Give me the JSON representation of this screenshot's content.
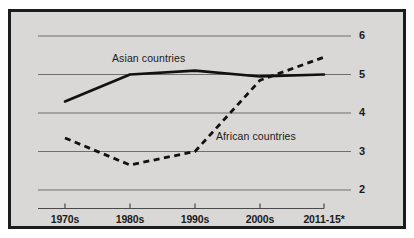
{
  "chart_data": {
    "type": "line",
    "title": "",
    "subtitle": "",
    "xlabel": "",
    "ylabel": "",
    "categories": [
      "1970s",
      "1980s",
      "1990s",
      "2000s",
      "2011-15*"
    ],
    "ylim": [
      1.6,
      6.3
    ],
    "yticks": [
      2,
      3,
      4,
      5,
      6
    ],
    "ytick_labels": [
      "2",
      "3",
      "4",
      "5",
      "6"
    ],
    "grid": true,
    "grid_axis": "y",
    "legend_position": "inline-annotations",
    "series": [
      {
        "name": "Asian countries",
        "style": "solid",
        "color": "#111111",
        "values": [
          4.3,
          5.0,
          5.1,
          4.95,
          5.0
        ]
      },
      {
        "name": "African countries",
        "style": "dashed",
        "color": "#111111",
        "values": [
          3.35,
          2.65,
          3.0,
          4.85,
          5.45
        ]
      }
    ],
    "annotations": [
      {
        "text": "Asian countries",
        "series": "Asian countries"
      },
      {
        "text": "African countries",
        "series": "African countries"
      }
    ]
  },
  "axes": {
    "y_labels": [
      "6",
      "5",
      "4",
      "3",
      "2"
    ],
    "x_labels": [
      "1970s",
      "1980s",
      "1990s",
      "2000s",
      "2011-15*"
    ]
  },
  "labels": {
    "asian": "Asian countries",
    "african": "African countries"
  },
  "colors": {
    "frame_border": "#1c1c1c",
    "panel_background": "#d9d8d6",
    "gridline": "#6f6f6f",
    "axis_line": "#4a4a4a",
    "series_line": "#111111",
    "text": "#1a1a1a"
  }
}
